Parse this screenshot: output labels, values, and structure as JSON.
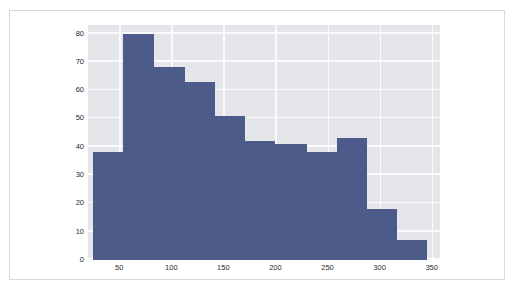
{
  "chart_data": {
    "type": "bar",
    "title": "",
    "subtitle": "",
    "xlabel": "",
    "ylabel": "",
    "xlim": [
      20,
      358
    ],
    "ylim": [
      0,
      83
    ],
    "grid": true,
    "legend": null,
    "legend_position": "none",
    "bar_color": "#4c5b8a",
    "plot_background": "#e5e6e9",
    "gridline_color": "#fbfbfc",
    "figure_background": "#ffffff",
    "border_color": "#d8d8d8",
    "axis_text_color": "#2a2a2a",
    "xticks": [
      50,
      100,
      150,
      200,
      250,
      300,
      350
    ],
    "xtick_labels": [
      "50",
      "100",
      "150",
      "200",
      "250",
      "300",
      "350"
    ],
    "yticks": [
      0,
      10,
      20,
      30,
      40,
      50,
      60,
      70,
      80
    ],
    "ytick_labels": [
      "0",
      "10",
      "20",
      "30",
      "40",
      "50",
      "60",
      "70",
      "80"
    ],
    "bin_edges": [
      25,
      54,
      83,
      113,
      142,
      171,
      200,
      230,
      259,
      288,
      317,
      346
    ],
    "categories": [
      "25-54",
      "54-83",
      "83-113",
      "113-142",
      "142-171",
      "171-200",
      "200-230",
      "230-259",
      "259-288",
      "288-317",
      "317-346"
    ],
    "values": [
      38,
      80,
      68,
      63,
      51,
      42,
      41,
      38,
      43,
      18,
      7
    ]
  }
}
